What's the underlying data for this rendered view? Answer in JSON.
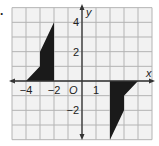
{
  "problem_label": ".",
  "graph": {
    "x_axis_label": "x",
    "y_axis_label": "y",
    "origin_label": "O",
    "x_range": [
      -5,
      5
    ],
    "y_range": [
      -4,
      5
    ],
    "grid_step": 1,
    "x_tick_labels": [
      {
        "value": -4,
        "text": "−4"
      },
      {
        "value": -2,
        "text": "−2"
      },
      {
        "value": 1,
        "text": "1"
      }
    ],
    "y_tick_labels": [
      {
        "value": 4,
        "text": "4"
      },
      {
        "value": 2,
        "text": "2"
      },
      {
        "value": -2,
        "text": "−2"
      }
    ],
    "colors": {
      "grid": "#b4b4b4",
      "axis": "#333333",
      "shape_fill": "#1a1a1a",
      "background": "#f2f2f2"
    },
    "shapes": [
      {
        "name": "figure-left",
        "vertices": [
          [
            -2,
            4
          ],
          [
            -3,
            2
          ],
          [
            -3,
            1
          ],
          [
            -4,
            0
          ],
          [
            -2,
            0
          ]
        ]
      },
      {
        "name": "figure-right",
        "vertices": [
          [
            2,
            -4
          ],
          [
            3,
            -2
          ],
          [
            3,
            -1
          ],
          [
            4,
            0
          ],
          [
            2,
            0
          ]
        ]
      }
    ]
  }
}
